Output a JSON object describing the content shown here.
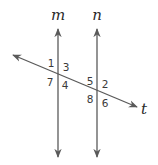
{
  "diagram": {
    "colors": {
      "line": "#5a5a5a",
      "text": "#2a2a2a"
    },
    "lines": {
      "m": {
        "label": "m"
      },
      "n": {
        "label": "n"
      },
      "t": {
        "label": "t"
      }
    },
    "angles": {
      "at_m": {
        "top_left": "1",
        "top_right": "3",
        "bottom_left": "7",
        "bottom_right": "4"
      },
      "at_n": {
        "top_left": "5",
        "top_right": "2",
        "bottom_left": "8",
        "bottom_right": "6"
      }
    }
  }
}
